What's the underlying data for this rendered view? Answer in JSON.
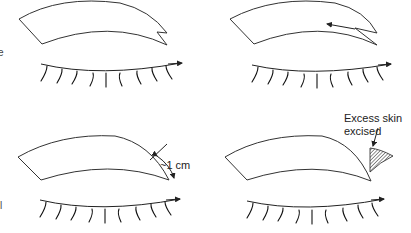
{
  "figure": {
    "panels": [
      {
        "id": "top-left",
        "label": ""
      },
      {
        "id": "top-right",
        "label": ""
      },
      {
        "id": "bottom-left",
        "label": "~1 cm"
      },
      {
        "id": "bottom-right",
        "label_line1": "Excess skin",
        "label_line2": "excised"
      }
    ],
    "edge_text": {
      "top": "e",
      "bottom": "l"
    }
  }
}
